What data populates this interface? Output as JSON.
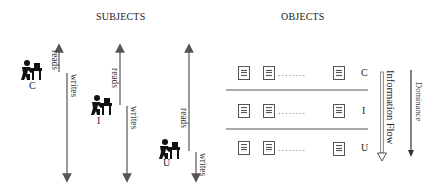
{
  "headers": {
    "subjects": "SUBJECTS",
    "objects": "OBJECTS"
  },
  "subjects": [
    {
      "level": "C",
      "read_label": "reads",
      "write_label": "writes",
      "icon": "person-at-desk-icon"
    },
    {
      "level": "I",
      "read_label": "reads",
      "write_label": "writes",
      "icon": "person-at-desk-icon"
    },
    {
      "level": "U",
      "read_label": "reads",
      "write_label": "writes",
      "icon": "person-at-desk-icon"
    }
  ],
  "objects": {
    "rows": [
      {
        "level": "C",
        "ellipsis": "........",
        "icon": "document-icon"
      },
      {
        "level": "I",
        "ellipsis": "........",
        "icon": "document-icon"
      },
      {
        "level": "U",
        "ellipsis": "........",
        "icon": "document-icon"
      }
    ],
    "information_flow_label": "Information Flow",
    "dominance_label": "Dominance"
  },
  "colors": {
    "line": "#555555",
    "icon": "#111111",
    "doc_fill": "#f2f2f2",
    "doc_stroke": "#555555"
  }
}
